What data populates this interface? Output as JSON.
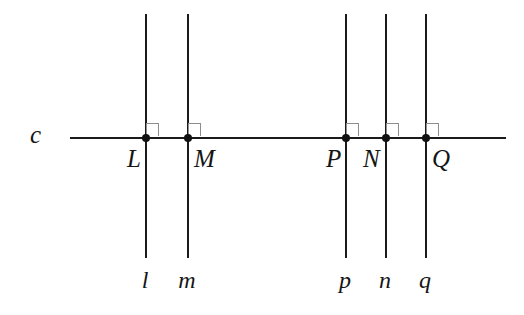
{
  "figure": {
    "background_color": "#ffffff",
    "line_color": "#1a1a1a",
    "marker_color": "#8d8d8d",
    "width": 524,
    "height": 315
  },
  "transversal": {
    "label": "c",
    "label_x": 30,
    "label_y": 122,
    "x1": 70,
    "x2": 506,
    "y": 137
  },
  "vertical_lines": [
    {
      "label": "l",
      "x": 145,
      "top": 14,
      "bottom": 258,
      "label_x": 145,
      "label_y": 268
    },
    {
      "label": "m",
      "x": 187,
      "top": 14,
      "bottom": 258,
      "label_x": 187,
      "label_y": 268
    },
    {
      "label": "p",
      "x": 345,
      "top": 14,
      "bottom": 258,
      "label_x": 345,
      "label_y": 268
    },
    {
      "label": "n",
      "x": 385,
      "top": 14,
      "bottom": 258,
      "label_x": 385,
      "label_y": 268
    },
    {
      "label": "q",
      "x": 425,
      "top": 14,
      "bottom": 258,
      "label_x": 425,
      "label_y": 268
    }
  ],
  "intersection_points": [
    {
      "label": "L",
      "x": 145,
      "y": 137,
      "label_x": 127,
      "label_y": 146,
      "side": "left"
    },
    {
      "label": "M",
      "x": 187,
      "y": 137,
      "label_x": 194,
      "label_y": 146,
      "side": "right"
    },
    {
      "label": "P",
      "x": 345,
      "y": 137,
      "label_x": 326,
      "label_y": 146,
      "side": "left"
    },
    {
      "label": "N",
      "x": 385,
      "y": 137,
      "label_x": 363,
      "label_y": 146,
      "side": "left"
    },
    {
      "label": "Q",
      "x": 425,
      "y": 137,
      "label_x": 432,
      "label_y": 146,
      "side": "right"
    }
  ],
  "right_angle_markers": [
    {
      "at": "L",
      "x": 146,
      "y": 123
    },
    {
      "at": "M",
      "x": 188,
      "y": 123
    },
    {
      "at": "P",
      "x": 346,
      "y": 123
    },
    {
      "at": "N",
      "x": 386,
      "y": 123
    },
    {
      "at": "Q",
      "x": 426,
      "y": 123
    }
  ]
}
